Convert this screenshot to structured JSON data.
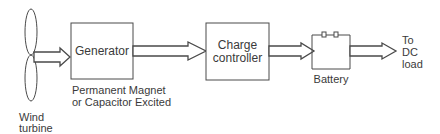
{
  "diagram": {
    "nodes": {
      "wind_turbine": {
        "label_line1": "Wind",
        "label_line2": "turbine"
      },
      "generator": {
        "label": "Generator",
        "caption_line1": "Permanent Magnet",
        "caption_line2": "or Capacitor Excited"
      },
      "charge_controller": {
        "label_line1": "Charge",
        "label_line2": "controller"
      },
      "battery": {
        "label": "Battery"
      },
      "dc_load": {
        "label_line1": "To",
        "label_line2": "DC",
        "label_line3": "load"
      }
    },
    "edges": [
      {
        "from": "wind_turbine",
        "to": "generator"
      },
      {
        "from": "generator",
        "to": "charge_controller"
      },
      {
        "from": "charge_controller",
        "to": "battery"
      },
      {
        "from": "battery",
        "to": "dc_load"
      }
    ],
    "colors": {
      "stroke": "#4a4a4a",
      "text": "#3a3a3a",
      "background": "#ffffff"
    }
  }
}
